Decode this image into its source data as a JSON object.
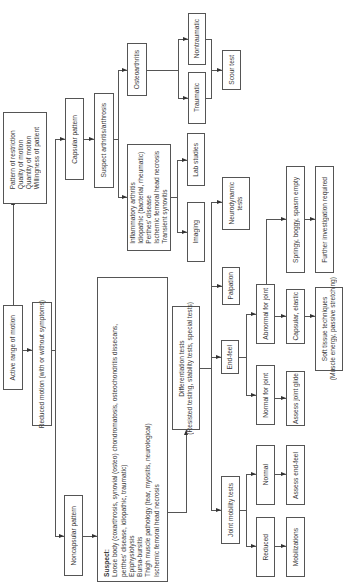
{
  "diagram": {
    "orientation": "rotated 90 degrees counter-clockwise",
    "nodes": {
      "active_rom": "Active range of motion",
      "assessment_factors": [
        "Pattern of restriction",
        "Quality of motion",
        "Quantity of motion",
        "Willingness of patient"
      ],
      "reduced_motion": "Reduced motion (with or without symptoms)",
      "capsular_pattern": "Capsular pattern",
      "suspect_arthritis": "Suspect arthritis/arthrosis",
      "osteoarthritis": "Osteoarthritis",
      "traumatic": "Traumatic",
      "nontraumatic": "Nontraumatic",
      "scour_test": "Scour test",
      "inflammatory_list": [
        "Inflammatory arthritis",
        "Idiopathic (bacterial, rheumatic)",
        "Perthes' disease",
        "Ischemic femoral head necrosis",
        "Transient synovitis"
      ],
      "lab_studies": "Lab studies",
      "imaging": "Imaging",
      "noncapsular_pattern": "Noncapsular pattern",
      "suspect_heading": "Suspect:",
      "suspect_list": [
        "Loose body (coxarthrosis, synovial (osteo) chondromatosis, osteochondritis dissecans,",
        "perthes' disease, idiopathic, traumatic)",
        "Epiphysiolysis",
        "Bursa-bursitis",
        "Thigh muscle pathology (tear, myositis, neurological)",
        "Ischemic femoral head necrosis"
      ],
      "differentiation_tests": [
        "Differentiation tests",
        "(Resisted testing, stability tests, special tests)"
      ],
      "neurodynamic_tests": [
        "Neurodynamic",
        "tests"
      ],
      "palpation": "Palpation",
      "end_feel": "End-feel",
      "joint_mobility_tests": "Joint mobility tests",
      "normal_for_joint": "Normal for joint",
      "abnormal_for_joint": "Abnormal for joint",
      "springy": "Springy, boggy, spasm empty",
      "further_investigation": "Further investigation required",
      "capsular_elastic": "Capsular, elastic",
      "soft_tissue": [
        "Soft tissue techniques",
        "(Muscle energy, passive stretching)"
      ],
      "assess_joint_glide": "Assess joint glide",
      "normal": "Normal",
      "reduced": "Reduced",
      "assess_end_feel": "Assess end-feel",
      "mobilizations": "Mobilizations"
    },
    "colors": {
      "line": "#555555",
      "text": "#3a3a3a",
      "background": "#ffffff"
    }
  }
}
